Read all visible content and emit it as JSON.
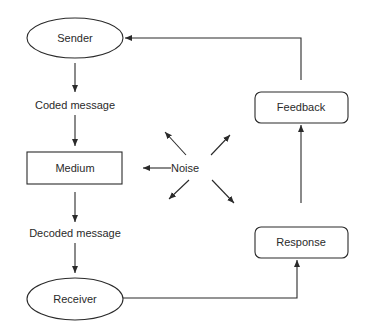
{
  "diagram": {
    "type": "communication-process-flow",
    "colors": {
      "stroke": "#2a2a2a",
      "text": "#2a2a2a",
      "background": "#ffffff"
    },
    "nodes": {
      "sender": {
        "label": "Sender",
        "shape": "ellipse"
      },
      "coded_message": {
        "label": "Coded message",
        "shape": "text"
      },
      "medium": {
        "label": "Medium",
        "shape": "rectangle"
      },
      "decoded_message": {
        "label": "Decoded message",
        "shape": "text"
      },
      "receiver": {
        "label": "Receiver",
        "shape": "ellipse"
      },
      "response": {
        "label": "Response",
        "shape": "rounded-rectangle"
      },
      "feedback": {
        "label": "Feedback",
        "shape": "rounded-rectangle"
      },
      "noise": {
        "label": "Noise",
        "shape": "text"
      }
    },
    "edges": [
      {
        "from": "Sender",
        "to": "Coded message"
      },
      {
        "from": "Coded message",
        "to": "Medium"
      },
      {
        "from": "Medium",
        "to": "Decoded message"
      },
      {
        "from": "Decoded message",
        "to": "Receiver"
      },
      {
        "from": "Receiver",
        "to": "Response"
      },
      {
        "from": "Response",
        "to": "Feedback"
      },
      {
        "from": "Feedback",
        "to": "Sender"
      },
      {
        "from": "Noise",
        "to": "Medium"
      },
      {
        "from": "Noise",
        "to": "up-left"
      },
      {
        "from": "Noise",
        "to": "up-right"
      },
      {
        "from": "Noise",
        "to": "down-left"
      },
      {
        "from": "Noise",
        "to": "down-right"
      }
    ]
  }
}
